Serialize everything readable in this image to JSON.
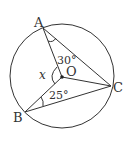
{
  "figure": {
    "type": "circle-geometry",
    "circle": {
      "center_label": "O",
      "cx": 62,
      "cy": 76,
      "r": 52
    },
    "points": {
      "A": {
        "label": "A",
        "x": 43,
        "y": 28
      },
      "B": {
        "label": "B",
        "x": 25,
        "y": 112
      },
      "C": {
        "label": "C",
        "x": 111,
        "y": 86
      },
      "O": {
        "label": "O",
        "x": 62,
        "y": 77
      }
    },
    "segments": [
      "OA",
      "OB",
      "OC",
      "AC",
      "BC"
    ],
    "angles": {
      "OAC": {
        "label": "30°"
      },
      "OBC": {
        "label": "25°"
      },
      "AOB": {
        "label": "x"
      }
    },
    "colors": {
      "stroke": "#333333",
      "background": "#ffffff"
    }
  }
}
